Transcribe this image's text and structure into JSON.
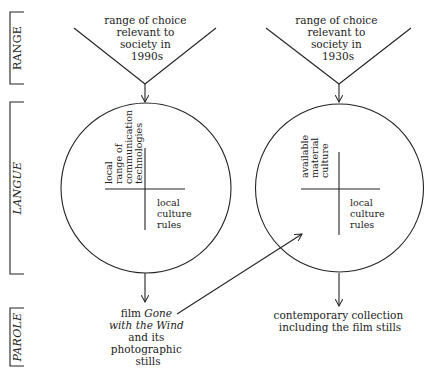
{
  "layers": {
    "range": "RANGE",
    "langue": "LANGUE",
    "parole": "PAROLE"
  },
  "left": {
    "range_lines": [
      "range of choice",
      "relevant to",
      "society in",
      "1990s"
    ],
    "quad_top_left": [
      "local",
      "range of",
      "communication",
      "technologies"
    ],
    "quad_bottom_right": [
      "local",
      "culture",
      "rules"
    ],
    "parole": {
      "line1_plain": "film ",
      "line1_italic": "Gone",
      "line2_italic": "with the Wind",
      "line3": "and its",
      "line4": "photographic",
      "line5": "stills"
    }
  },
  "right": {
    "range_lines": [
      "range of choice",
      "relevant to",
      "society in",
      "1930s"
    ],
    "quad_top_left": [
      "available",
      "material",
      "culture"
    ],
    "quad_bottom_right": [
      "local",
      "culture",
      "rules"
    ],
    "parole": [
      "contemporary collection",
      "including the film stills"
    ]
  },
  "colors": {
    "line": "#222222",
    "background": "#ffffff"
  }
}
